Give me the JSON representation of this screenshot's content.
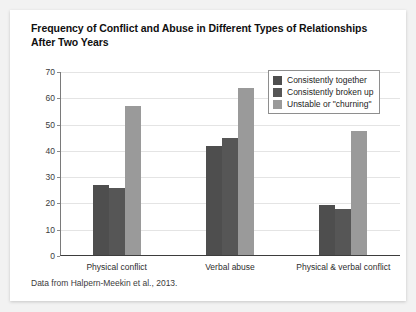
{
  "card": {
    "title": "Frequency of Conflict and Abuse in Different Types of Relationships After Two Years",
    "source_note": "Data from Halpern-Meekin et al., 2013."
  },
  "legend": {
    "items": [
      {
        "label": "Consistently together",
        "color": "#4e4e4e"
      },
      {
        "label": "Consistently broken up",
        "color": "#565656"
      },
      {
        "label": "Unstable or \"churning\"",
        "color": "#9a9a9a"
      }
    ]
  },
  "axis": {
    "y_ticks": [
      "0",
      "10",
      "20",
      "30",
      "40",
      "50",
      "60",
      "70"
    ]
  },
  "chart_data": {
    "type": "bar",
    "title": "Frequency of Conflict and Abuse in Different Types of Relationships After Two Years",
    "xlabel": "",
    "ylabel": "",
    "ylim": [
      0,
      70
    ],
    "ytick_step": 10,
    "grid": true,
    "legend_position": "top-right",
    "categories": [
      "Physical conflict",
      "Verbal abuse",
      "Physical & verbal conflict"
    ],
    "series": [
      {
        "name": "Consistently together",
        "color": "#4e4e4e",
        "values": [
          27,
          42,
          19.5
        ]
      },
      {
        "name": "Consistently broken up",
        "color": "#565656",
        "values": [
          26,
          45,
          18
        ]
      },
      {
        "name": "Unstable or \"churning\"",
        "color": "#9a9a9a",
        "values": [
          57,
          64,
          47.5
        ]
      }
    ],
    "annotation": "Data from Halpern-Meekin et al., 2013."
  }
}
